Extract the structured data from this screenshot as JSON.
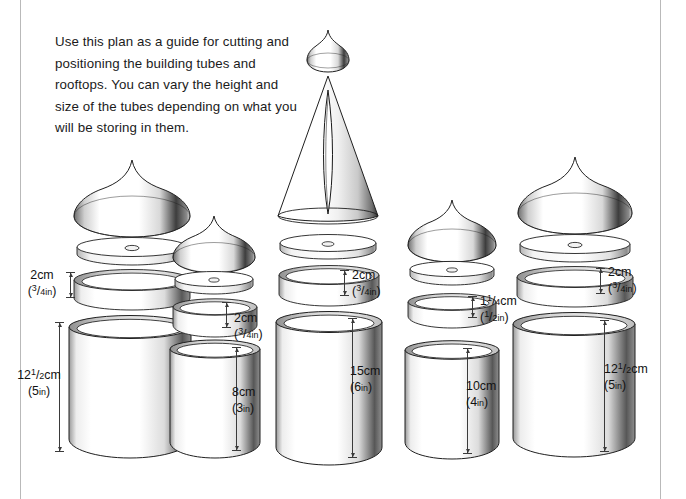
{
  "document": {
    "intro_text": "Use this plan as a guide for cutting and positioning the building tubes and rooftops. You can vary the height and size of the tubes depending on what you will be storing in them."
  },
  "colors": {
    "ink": "#1a1a1a",
    "rule": "#b9b9b9",
    "outline": "#1f1f1f",
    "shade_dark": "#3f3f3f",
    "shade_light": "#ffffff",
    "dimension_line": "#3a3a3a"
  },
  "stacks": [
    {
      "id": "stack-1",
      "roof_type": "onion-dome",
      "lid_label": {
        "metric": "2cm",
        "imperial_num": "3",
        "imperial_den": "4",
        "imperial_unit": "in"
      },
      "tube_label": {
        "metric_whole": "12",
        "metric_num": "1",
        "metric_den": "2",
        "metric_unit": "cm",
        "imperial": "5",
        "imperial_unit": "in"
      }
    },
    {
      "id": "stack-2",
      "roof_type": "onion-dome",
      "lid_label": {
        "metric": "2cm",
        "imperial_num": "3",
        "imperial_den": "4",
        "imperial_unit": "in"
      },
      "tube_label": {
        "metric_whole": "8",
        "metric_unit": "cm",
        "imperial": "3",
        "imperial_unit": "in"
      }
    },
    {
      "id": "stack-3",
      "roof_type": "tall-cone-with-finial",
      "lid_label": {
        "metric": "2cm",
        "imperial_num": "3",
        "imperial_den": "4",
        "imperial_unit": "in"
      },
      "tube_label": {
        "metric_whole": "15",
        "metric_unit": "cm",
        "imperial": "6",
        "imperial_unit": "in"
      }
    },
    {
      "id": "stack-4",
      "roof_type": "onion-dome",
      "lid_label": {
        "metric_whole": "1",
        "metric_num": "1",
        "metric_den": "4",
        "metric_unit": "cm",
        "imperial_num": "1",
        "imperial_den": "2",
        "imperial_unit": "in"
      },
      "tube_label": {
        "metric_whole": "10",
        "metric_unit": "cm",
        "imperial": "4",
        "imperial_unit": "in"
      }
    },
    {
      "id": "stack-5",
      "roof_type": "onion-dome",
      "lid_label": {
        "metric": "2cm",
        "imperial_num": "3",
        "imperial_den": "4",
        "imperial_unit": "in"
      },
      "tube_label": {
        "metric_whole": "12",
        "metric_num": "1",
        "metric_den": "2",
        "metric_unit": "cm",
        "imperial": "5",
        "imperial_unit": "in"
      }
    }
  ]
}
